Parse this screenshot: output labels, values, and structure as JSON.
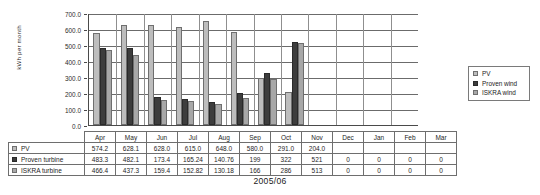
{
  "caption": "2005/06",
  "legend": {
    "position": "right",
    "items": [
      {
        "label": "PV",
        "key": "pv",
        "color": "#bdbdbd"
      },
      {
        "label": "Proven wind",
        "key": "proven",
        "color": "#3d3d3d"
      },
      {
        "label": "ISKRA wind",
        "key": "iskra",
        "color": "#a8a8a8"
      }
    ]
  },
  "table": {
    "rows": [
      {
        "label": "PV",
        "swatch": "pv",
        "values": [
          "574.2",
          "628.1",
          "628.0",
          "615.0",
          "648.0",
          "580.0",
          "291.0",
          "204.0",
          "",
          "",
          "",
          ""
        ]
      },
      {
        "label": "Proven turbine",
        "swatch": "proven",
        "values": [
          "483.3",
          "482.1",
          "173.4",
          "165.24",
          "140.76",
          "199",
          "322",
          "521",
          "0",
          "0",
          "0",
          "0"
        ]
      },
      {
        "label": "ISKRA turbine",
        "swatch": "iskra",
        "values": [
          "466.4",
          "437.3",
          "159.4",
          "152.82",
          "130.18",
          "166",
          "286",
          "513",
          "0",
          "0",
          "0",
          "0"
        ]
      }
    ]
  },
  "chart_data": {
    "type": "bar",
    "title": "",
    "subtitle": "",
    "xlabel": "2005/06",
    "ylabel": "kWh per month",
    "categories": [
      "Apr",
      "May",
      "Jun",
      "Jul",
      "Aug",
      "Sep",
      "Oct",
      "Nov",
      "Dec",
      "Jan",
      "Feb",
      "Mar"
    ],
    "series": [
      {
        "name": "PV",
        "key": "pv",
        "color": "#bdbdbd",
        "values": [
          574.2,
          628.1,
          628.0,
          615.0,
          648.0,
          580.0,
          291.0,
          204.0,
          null,
          null,
          null,
          null
        ]
      },
      {
        "name": "Proven wind",
        "key": "proven",
        "color": "#3d3d3d",
        "values": [
          483.3,
          482.1,
          173.4,
          165.24,
          140.76,
          199,
          322,
          521,
          0,
          0,
          0,
          0
        ]
      },
      {
        "name": "ISKRA wind",
        "key": "iskra",
        "color": "#a8a8a8",
        "values": [
          466.4,
          437.3,
          159.4,
          152.82,
          130.18,
          166,
          286,
          513,
          0,
          0,
          0,
          0
        ]
      }
    ],
    "ylim": [
      0,
      700
    ],
    "ytick_step": 100,
    "ytick_labels": [
      "0.0",
      "100.0",
      "200.0",
      "300.0",
      "400.0",
      "500.0",
      "600.0",
      "700.0"
    ],
    "grid": "horizontal",
    "legend_position": "right"
  }
}
